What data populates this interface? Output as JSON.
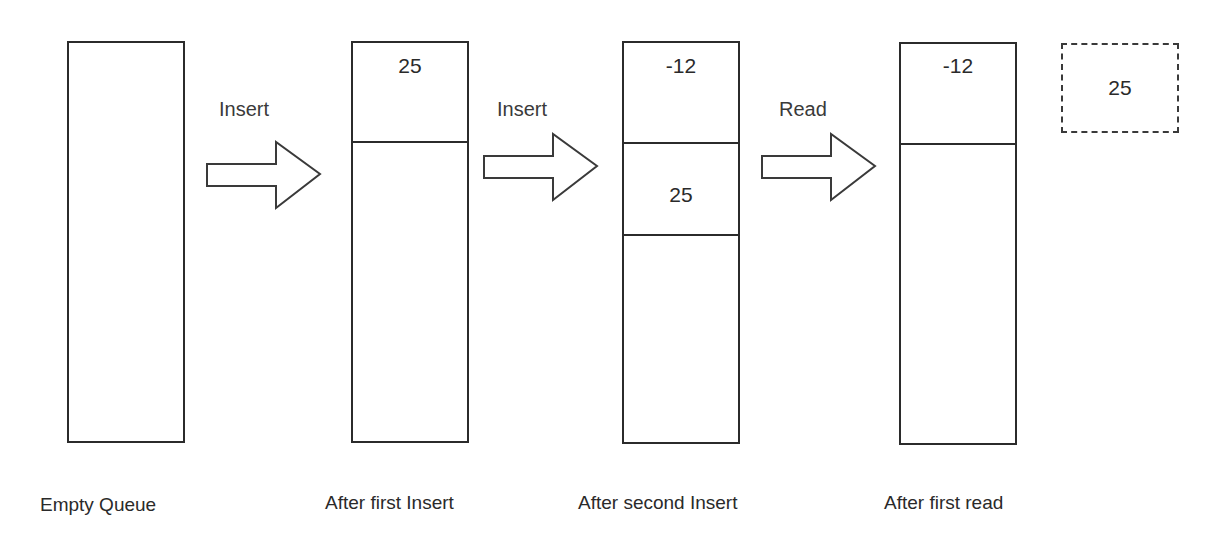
{
  "diagram": {
    "type": "queue-operations",
    "states": [
      {
        "caption": "After first Insert",
        "cells": [
          "25"
        ]
      },
      {
        "caption": "Empty Queue",
        "cells": []
      },
      {
        "caption": "After second Insert",
        "cells": [
          "-12",
          "25"
        ]
      },
      {
        "caption": "After first read",
        "cells": [
          "-12"
        ]
      }
    ],
    "captions": {
      "empty": "Empty Queue",
      "first_insert": "After first Insert",
      "second_insert": "After second Insert",
      "first_read": "After first read"
    },
    "operations": {
      "op1": "Insert",
      "op2": "Insert",
      "op3": "Read"
    },
    "cells": {
      "state2_cell1": "25",
      "state3_cell1": "-12",
      "state3_cell2": "25",
      "state4_cell1": "-12"
    },
    "read_output": "25"
  }
}
